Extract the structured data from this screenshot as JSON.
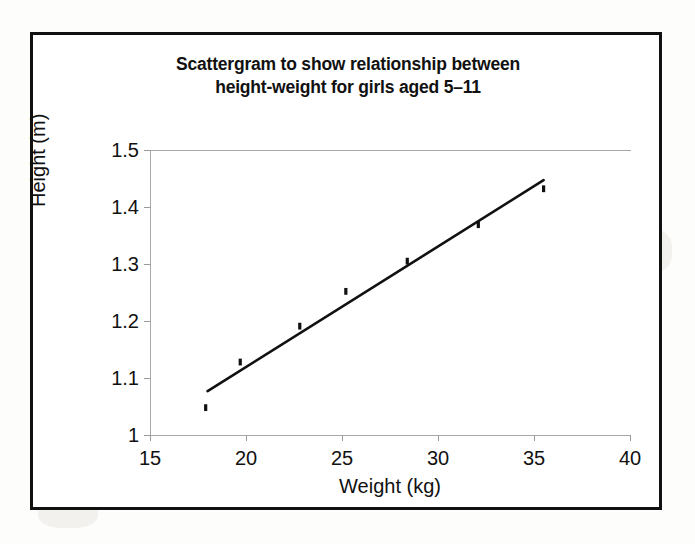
{
  "page": {
    "background_color": "#fdfdfb",
    "frame_color": "#111111"
  },
  "chart_data": {
    "type": "scatter",
    "title": "Scattergram to show relationship between height-weight for girls aged 5–11",
    "title_line_1": "Scattergram to show relationship between",
    "title_line_2": "height-weight for girls aged 5–11",
    "xlabel": "Weight (kg)",
    "ylabel": "Height (m)",
    "xlim": [
      15,
      40
    ],
    "ylim": [
      1.0,
      1.5
    ],
    "xticks": [
      15,
      20,
      25,
      30,
      35,
      40
    ],
    "xtick_labels": [
      "15",
      "20",
      "25",
      "30",
      "35",
      "40"
    ],
    "yticks": [
      1.0,
      1.1,
      1.2,
      1.3,
      1.4,
      1.5
    ],
    "ytick_labels": [
      "1",
      "1.1",
      "1.2",
      "1.3",
      "1.4",
      "1.5"
    ],
    "grid": false,
    "legend": null,
    "marker_color": "#111111",
    "line_color": "#111111",
    "axis_color": "#a8a8a8",
    "x": [
      17.9,
      19.7,
      22.8,
      25.2,
      28.4,
      32.1,
      35.5
    ],
    "y": [
      1.048,
      1.128,
      1.191,
      1.252,
      1.305,
      1.369,
      1.432
    ],
    "points": [
      {
        "weight": 17.9,
        "height": 1.048
      },
      {
        "weight": 19.7,
        "height": 1.128
      },
      {
        "weight": 22.8,
        "height": 1.191
      },
      {
        "weight": 25.2,
        "height": 1.252
      },
      {
        "weight": 28.4,
        "height": 1.305
      },
      {
        "weight": 32.1,
        "height": 1.369
      },
      {
        "weight": 35.5,
        "height": 1.432
      }
    ],
    "trendline": {
      "type": "linear-fit",
      "x_start": 18.0,
      "y_start": 1.077,
      "x_end": 35.5,
      "y_end": 1.447
    }
  }
}
